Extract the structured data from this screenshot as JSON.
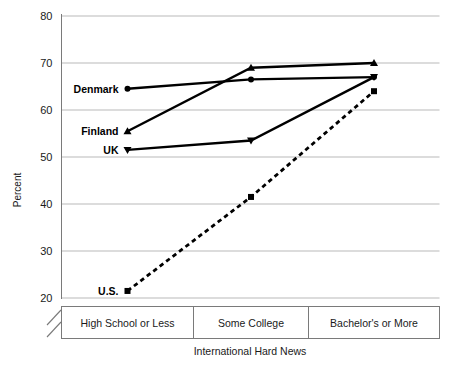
{
  "chart_data": {
    "type": "line",
    "title": "",
    "xlabel": "International Hard News",
    "ylabel": "Percent",
    "categories": [
      "High School or Less",
      "Some College",
      "Bachelor's or More"
    ],
    "ylim": [
      20,
      80
    ],
    "yticks": [
      20,
      30,
      40,
      50,
      60,
      70,
      80
    ],
    "ytick_labels": [
      "20",
      "30",
      "40",
      "50",
      "60",
      "70",
      "80"
    ],
    "grid": "horizontal",
    "legend": "inline-labels-left",
    "y_axis_break": true,
    "series": [
      {
        "name": "Denmark",
        "label": "Denmark",
        "marker": "circle",
        "linestyle": "solid",
        "color": "#000000",
        "values": [
          64.5,
          66.5,
          67.0
        ]
      },
      {
        "name": "Finland",
        "label": "Finland",
        "marker": "triangle-up",
        "linestyle": "solid",
        "color": "#000000",
        "values": [
          55.5,
          69.0,
          70.0
        ]
      },
      {
        "name": "UK",
        "label": "UK",
        "marker": "triangle-down",
        "linestyle": "solid",
        "color": "#000000",
        "values": [
          51.5,
          53.5,
          67.0
        ]
      },
      {
        "name": "U.S.",
        "label": "U.S.",
        "marker": "square",
        "linestyle": "dashed",
        "color": "#000000",
        "values": [
          21.5,
          41.5,
          64.0
        ]
      }
    ]
  },
  "colors": {
    "ink": "#000000",
    "gridline": "#b9b9b9",
    "axis": "#7a7a7a",
    "background": "#ffffff"
  }
}
